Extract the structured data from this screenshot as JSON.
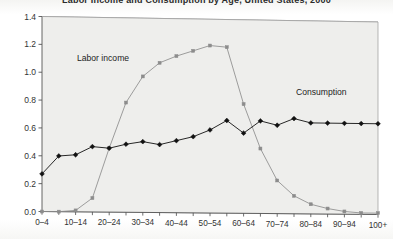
{
  "chart_data": {
    "type": "line",
    "title": "Labor Income and Consumption by Age, United States, 2000",
    "xlabel": "",
    "ylabel": "",
    "ylim": [
      0.0,
      1.4
    ],
    "y_ticks": [
      "0.0",
      "0.2",
      "0.4",
      "0.6",
      "0.8",
      "1.0",
      "1.2",
      "1.4"
    ],
    "y_tick_values": [
      0.0,
      0.2,
      0.4,
      0.6,
      0.8,
      1.0,
      1.2,
      1.4
    ],
    "grid": true,
    "legend_position": "inline-annotations",
    "categories": [
      "0–4",
      "5–9",
      "10–14",
      "15–19",
      "20–24",
      "25–29",
      "30–34",
      "35–39",
      "40–44",
      "45–49",
      "50–54",
      "55–59",
      "60–64",
      "65–69",
      "70–74",
      "75–79",
      "80–84",
      "85–89",
      "90–94",
      "95–99",
      "100+"
    ],
    "x_tick_labels_shown": [
      "0–4",
      "",
      "10–14",
      "",
      "20–24",
      "",
      "30–34",
      "",
      "40–44",
      "",
      "50–54",
      "",
      "60–64",
      "",
      "70–74",
      "",
      "80–84",
      "",
      "90–94",
      "",
      "100+"
    ],
    "series": [
      {
        "name": "Labor income",
        "marker": "square",
        "color": "#8c8c8c",
        "values": [
          0.0,
          0.0,
          0.01,
          0.1,
          0.46,
          0.79,
          0.98,
          1.08,
          1.13,
          1.17,
          1.21,
          1.2,
          0.79,
          0.47,
          0.24,
          0.13,
          0.07,
          0.04,
          0.02,
          0.01,
          0.01
        ]
      },
      {
        "name": "Consumption",
        "marker": "diamond",
        "color": "#111111",
        "values": [
          0.27,
          0.4,
          0.41,
          0.47,
          0.46,
          0.49,
          0.51,
          0.49,
          0.52,
          0.55,
          0.6,
          0.67,
          0.58,
          0.67,
          0.64,
          0.69,
          0.66,
          0.66,
          0.66,
          0.66,
          0.66
        ]
      }
    ],
    "annotations": [
      {
        "text": "Labor income",
        "series": "Labor income"
      },
      {
        "text": "Consumption",
        "series": "Consumption"
      }
    ]
  }
}
